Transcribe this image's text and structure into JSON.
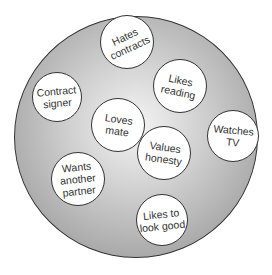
{
  "diagram": {
    "type": "circle-of-traits",
    "outer_circle": {
      "fill": "radial-gradient-gray",
      "stroke": "#333333"
    },
    "nodes": [
      {
        "id": "hates-contracts",
        "label": "Hates contracts",
        "lines": [
          "Hates",
          "contracts"
        ],
        "cx": 127,
        "cy": 42,
        "r": 27,
        "rotate": -25
      },
      {
        "id": "contract-signer",
        "label": "Contract signer",
        "lines": [
          "Contract",
          "signer"
        ],
        "cx": 57,
        "cy": 97,
        "r": 25,
        "rotate": -5
      },
      {
        "id": "likes-reading",
        "label": "Likes reading",
        "lines": [
          "Likes",
          "reading"
        ],
        "cx": 180,
        "cy": 86,
        "r": 27,
        "rotate": 12
      },
      {
        "id": "loves-mate",
        "label": "Loves mate",
        "lines": [
          "Loves",
          "mate"
        ],
        "cx": 118,
        "cy": 125,
        "r": 27,
        "rotate": 8
      },
      {
        "id": "watches-tv",
        "label": "Watches TV",
        "lines": [
          "Watches",
          "TV"
        ],
        "cx": 233,
        "cy": 136,
        "r": 26,
        "rotate": 5
      },
      {
        "id": "values-honesty",
        "label": "Values honesty",
        "lines": [
          "Values",
          "honesty"
        ],
        "cx": 164,
        "cy": 153,
        "r": 27,
        "rotate": 8
      },
      {
        "id": "wants-another-partner",
        "label": "Wants another partner",
        "lines": [
          "Wants",
          "another",
          "partner"
        ],
        "cx": 78,
        "cy": 179,
        "r": 27,
        "rotate": -6
      },
      {
        "id": "likes-to-look-good",
        "label": "Likes to look good",
        "lines": [
          "Likes to",
          "look good"
        ],
        "cx": 162,
        "cy": 220,
        "r": 26,
        "rotate": -6
      }
    ]
  }
}
